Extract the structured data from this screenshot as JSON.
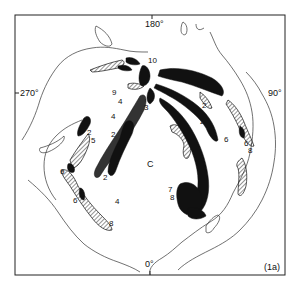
{
  "figure": {
    "panel_label": "(1a)",
    "axis_labels": {
      "top": "180°",
      "bottom": "0°",
      "left": "270°",
      "right": "90°"
    },
    "center_label": "C",
    "region_numbers": [
      {
        "text": "10",
        "x": 150,
        "y": 60
      },
      {
        "text": "3",
        "x": 145,
        "y": 80
      },
      {
        "text": "3",
        "x": 145,
        "y": 110
      },
      {
        "text": "9",
        "x": 113,
        "y": 93
      },
      {
        "text": "4",
        "x": 116,
        "y": 103
      },
      {
        "text": "4",
        "x": 111,
        "y": 117
      },
      {
        "text": "2",
        "x": 93,
        "y": 127
      },
      {
        "text": "5",
        "x": 91,
        "y": 140
      },
      {
        "text": "2",
        "x": 111,
        "y": 134
      },
      {
        "text": "4",
        "x": 117,
        "y": 150
      },
      {
        "text": "2",
        "x": 104,
        "y": 176
      },
      {
        "text": "6",
        "x": 60,
        "y": 171
      },
      {
        "text": "6",
        "x": 74,
        "y": 198
      },
      {
        "text": "8",
        "x": 111,
        "y": 223
      },
      {
        "text": "4",
        "x": 116,
        "y": 200
      },
      {
        "text": "2",
        "x": 204,
        "y": 104
      },
      {
        "text": "2",
        "x": 202,
        "y": 122
      },
      {
        "text": "4",
        "x": 185,
        "y": 125
      },
      {
        "text": "6",
        "x": 193,
        "y": 143
      },
      {
        "text": "6",
        "x": 224,
        "y": 138
      },
      {
        "text": "6",
        "x": 244,
        "y": 142
      },
      {
        "text": "8",
        "x": 247,
        "y": 148
      },
      {
        "text": "7",
        "x": 170,
        "y": 189
      },
      {
        "text": "8",
        "x": 172,
        "y": 196
      }
    ],
    "legend_patterns": [
      "solid-black",
      "hatched",
      "contour-line"
    ]
  }
}
